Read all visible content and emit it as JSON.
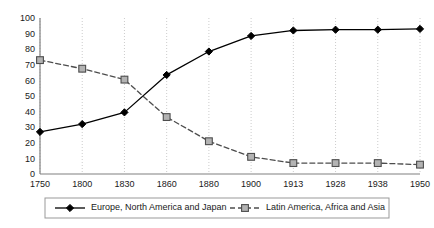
{
  "chart_data": {
    "type": "line",
    "title": "",
    "subtitle": "",
    "xlabel": "",
    "ylabel": "",
    "x": [
      "1750",
      "1800",
      "1830",
      "1860",
      "1880",
      "1900",
      "1913",
      "1928",
      "1938",
      "1950"
    ],
    "categories": [
      "1750",
      "1800",
      "1830",
      "1860",
      "1880",
      "1900",
      "1913",
      "1928",
      "1938",
      "1950"
    ],
    "xtick_labels": [
      "1750",
      "1800",
      "1830",
      "1860",
      "1880",
      "1900",
      "1913",
      "1928",
      "1938",
      "1950"
    ],
    "ytick_labels": [
      "0",
      "10",
      "20",
      "30",
      "40",
      "50",
      "60",
      "70",
      "80",
      "90",
      "100"
    ],
    "ytick_values": [
      0,
      10,
      20,
      30,
      40,
      50,
      60,
      70,
      80,
      90,
      100
    ],
    "ylim": [
      0,
      100
    ],
    "grid": "vertical-dotted",
    "grid_color": "#cccccc",
    "legend_position": "bottom",
    "series": [
      {
        "name": "Europe, North America and Japan",
        "values": [
          27,
          32,
          39.5,
          63.5,
          78.5,
          88.5,
          92,
          92.5,
          92.5,
          93
        ],
        "line_style": "solid",
        "marker": "diamond",
        "color": "#000000",
        "marker_fill": "#000000"
      },
      {
        "name": "Latin America, Africa and Asia",
        "values": [
          73,
          67.5,
          60.5,
          36.5,
          21,
          11,
          7,
          7,
          7,
          6
        ],
        "line_style": "dashed",
        "marker": "square",
        "color": "#4d4d4d",
        "marker_fill": "#b3b3b3"
      }
    ]
  },
  "legend": {
    "entries": [
      {
        "label": "Europe, North America and Japan"
      },
      {
        "label": "Latin America, Africa and Asia"
      }
    ]
  },
  "colors": {
    "axis": "#808080",
    "grid": "#cccccc",
    "series_solid": "#000000",
    "series_dashed": "#4d4d4d",
    "marker_square_fill": "#b3b3b3",
    "legend_border": "#999999",
    "text": "#1a1a1a"
  }
}
